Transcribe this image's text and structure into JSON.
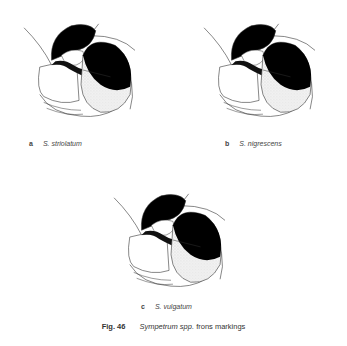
{
  "figures": [
    {
      "letter": "a",
      "species": "S. striolatum"
    },
    {
      "letter": "b",
      "species": "S. nigrescens"
    },
    {
      "letter": "c",
      "species": "S. vulgatum"
    }
  ],
  "caption": {
    "number": "Fig. 46",
    "genus": "Sympetrum spp.",
    "text": "frons markings"
  }
}
